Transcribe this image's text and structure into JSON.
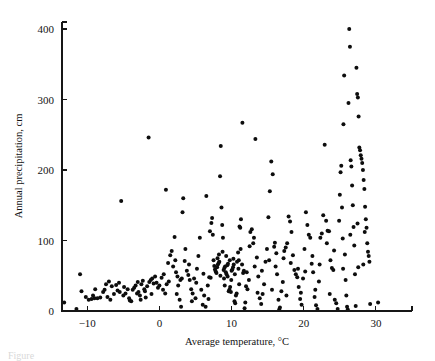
{
  "figure": {
    "caption": "Figure",
    "background_color": "#ffffff",
    "point_color": "#0d0d0d",
    "axis_color": "#161616"
  },
  "chart_data": {
    "type": "scatter",
    "title": "",
    "xlabel": "Average temperature, °C",
    "ylabel": "Annual precipitation, cm",
    "xlim": [
      -13.5,
      35.0
    ],
    "ylim": [
      0,
      410
    ],
    "xticks": [
      -10,
      0,
      10,
      20,
      30
    ],
    "xtick_labels": [
      "−10",
      "0",
      "10",
      "20",
      "30"
    ],
    "yticks": [
      0,
      100,
      200,
      300,
      400
    ],
    "ytick_labels": [
      "0",
      "100",
      "200",
      "300",
      "400"
    ],
    "grid": false,
    "legend": null,
    "marker": "filled-circle",
    "marker_size_px": 4.0,
    "series": [
      {
        "name": "Weather stations",
        "points": [
          [
            -13.2,
            12
          ],
          [
            -11.5,
            3
          ],
          [
            -11.0,
            52
          ],
          [
            -10.8,
            28
          ],
          [
            -10.2,
            20
          ],
          [
            -9.8,
            16
          ],
          [
            -9.4,
            17
          ],
          [
            -9.0,
            18
          ],
          [
            -8.6,
            18
          ],
          [
            -8.2,
            19
          ],
          [
            -7.8,
            27
          ],
          [
            -7.4,
            38
          ],
          [
            -7.0,
            42
          ],
          [
            -6.6,
            35
          ],
          [
            -6.3,
            24
          ],
          [
            -6.0,
            37
          ],
          [
            -5.6,
            40
          ],
          [
            -5.3,
            156
          ],
          [
            -5.0,
            22
          ],
          [
            -4.7,
            25
          ],
          [
            -4.4,
            31
          ],
          [
            -4.1,
            15
          ],
          [
            -3.9,
            14
          ],
          [
            -3.7,
            30
          ],
          [
            -3.5,
            33
          ],
          [
            -3.3,
            36
          ],
          [
            -3.1,
            25
          ],
          [
            -2.9,
            27
          ],
          [
            -2.7,
            22
          ],
          [
            -2.5,
            38
          ],
          [
            -2.3,
            43
          ],
          [
            -2.1,
            31
          ],
          [
            -1.9,
            19
          ],
          [
            -1.7,
            35
          ],
          [
            -1.5,
            246
          ],
          [
            -1.4,
            41
          ],
          [
            -1.2,
            44
          ],
          [
            -1.0,
            46
          ],
          [
            -0.8,
            39
          ],
          [
            -0.6,
            49
          ],
          [
            -0.4,
            40
          ],
          [
            -0.2,
            33
          ],
          [
            0.0,
            36
          ],
          [
            0.3,
            47
          ],
          [
            0.6,
            52
          ],
          [
            0.9,
            172
          ],
          [
            1.0,
            38
          ],
          [
            1.3,
            42
          ],
          [
            1.5,
            79
          ],
          [
            1.7,
            85
          ],
          [
            1.9,
            63
          ],
          [
            2.1,
            105
          ],
          [
            2.3,
            55
          ],
          [
            2.5,
            49
          ],
          [
            2.6,
            36
          ],
          [
            2.8,
            16
          ],
          [
            2.9,
            44
          ],
          [
            3.0,
            6
          ],
          [
            3.2,
            140
          ],
          [
            3.3,
            160
          ],
          [
            3.5,
            71
          ],
          [
            3.6,
            88
          ],
          [
            3.8,
            57
          ],
          [
            4.0,
            51
          ],
          [
            4.2,
            44
          ],
          [
            4.4,
            31
          ],
          [
            4.6,
            25
          ],
          [
            4.8,
            46
          ],
          [
            5.0,
            18
          ],
          [
            5.2,
            60
          ],
          [
            5.4,
            78
          ],
          [
            5.6,
            104
          ],
          [
            5.8,
            30
          ],
          [
            6.0,
            9
          ],
          [
            6.2,
            22
          ],
          [
            6.4,
            6
          ],
          [
            6.5,
            163
          ],
          [
            6.7,
            36
          ],
          [
            6.9,
            48
          ],
          [
            7.0,
            113
          ],
          [
            7.2,
            125
          ],
          [
            7.3,
            132
          ],
          [
            7.4,
            108
          ],
          [
            7.5,
            72
          ],
          [
            7.6,
            64
          ],
          [
            7.7,
            59
          ],
          [
            7.8,
            56
          ],
          [
            7.9,
            54
          ],
          [
            8.0,
            62
          ],
          [
            8.1,
            66
          ],
          [
            8.2,
            68
          ],
          [
            8.3,
            70
          ],
          [
            8.4,
            191
          ],
          [
            8.5,
            234
          ],
          [
            8.6,
            147
          ],
          [
            8.7,
            122
          ],
          [
            8.8,
            104
          ],
          [
            8.9,
            58
          ],
          [
            9.0,
            61
          ],
          [
            9.1,
            63
          ],
          [
            9.2,
            55
          ],
          [
            9.3,
            52
          ],
          [
            9.4,
            65
          ],
          [
            9.5,
            67
          ],
          [
            9.6,
            28
          ],
          [
            9.7,
            30
          ],
          [
            9.8,
            34
          ],
          [
            9.9,
            27
          ],
          [
            10.0,
            57
          ],
          [
            10.1,
            59
          ],
          [
            10.2,
            62
          ],
          [
            10.3,
            66
          ],
          [
            10.4,
            14
          ],
          [
            10.5,
            11
          ],
          [
            10.6,
            22
          ],
          [
            10.7,
            25
          ],
          [
            10.9,
            83
          ],
          [
            11.0,
            72
          ],
          [
            11.1,
            120
          ],
          [
            11.2,
            118
          ],
          [
            11.3,
            130
          ],
          [
            11.5,
            267
          ],
          [
            11.6,
            54
          ],
          [
            11.7,
            57
          ],
          [
            11.8,
            4
          ],
          [
            11.9,
            12
          ],
          [
            12.0,
            35
          ],
          [
            12.2,
            31
          ],
          [
            12.4,
            44
          ],
          [
            12.6,
            112
          ],
          [
            12.8,
            116
          ],
          [
            13.0,
            96
          ],
          [
            13.1,
            104
          ],
          [
            13.3,
            244
          ],
          [
            13.5,
            76
          ],
          [
            13.7,
            49
          ],
          [
            13.9,
            18
          ],
          [
            14.1,
            10
          ],
          [
            14.3,
            24
          ],
          [
            14.5,
            38
          ],
          [
            14.7,
            70
          ],
          [
            14.9,
            88
          ],
          [
            15.1,
            133
          ],
          [
            15.3,
            170
          ],
          [
            15.5,
            212
          ],
          [
            15.7,
            194
          ],
          [
            15.9,
            91
          ],
          [
            16.0,
            97
          ],
          [
            16.1,
            63
          ],
          [
            16.3,
            52
          ],
          [
            16.5,
            16
          ],
          [
            16.6,
            2
          ],
          [
            16.7,
            5
          ],
          [
            16.9,
            28
          ],
          [
            17.1,
            41
          ],
          [
            17.3,
            85
          ],
          [
            17.5,
            90
          ],
          [
            17.7,
            96
          ],
          [
            17.9,
            134
          ],
          [
            18.1,
            127
          ],
          [
            18.3,
            112
          ],
          [
            18.5,
            79
          ],
          [
            18.7,
            58
          ],
          [
            18.9,
            52
          ],
          [
            19.1,
            48
          ],
          [
            19.3,
            34
          ],
          [
            19.5,
            17
          ],
          [
            19.7,
            9
          ],
          [
            19.9,
            46
          ],
          [
            20.1,
            88
          ],
          [
            20.3,
            140
          ],
          [
            20.5,
            122
          ],
          [
            20.7,
            108
          ],
          [
            20.9,
            104
          ],
          [
            21.1,
            67
          ],
          [
            21.3,
            55
          ],
          [
            21.5,
            20
          ],
          [
            21.7,
            8
          ],
          [
            21.9,
            3
          ],
          [
            22.1,
            42
          ],
          [
            22.3,
            104
          ],
          [
            22.5,
            110
          ],
          [
            22.7,
            136
          ],
          [
            22.9,
            236
          ],
          [
            23.1,
            128
          ],
          [
            23.3,
            114
          ],
          [
            23.5,
            113
          ],
          [
            23.7,
            72
          ],
          [
            23.9,
            61
          ],
          [
            24.1,
            58
          ],
          [
            24.3,
            16
          ],
          [
            24.5,
            11
          ],
          [
            24.7,
            3
          ],
          [
            24.9,
            128
          ],
          [
            25.0,
            165
          ],
          [
            25.1,
            197
          ],
          [
            25.2,
            206
          ],
          [
            25.3,
            147
          ],
          [
            25.5,
            265
          ],
          [
            25.6,
            334
          ],
          [
            25.7,
            80
          ],
          [
            25.8,
            44
          ],
          [
            25.9,
            22
          ],
          [
            26.0,
            6
          ],
          [
            26.1,
            2
          ],
          [
            26.2,
            295
          ],
          [
            26.3,
            400
          ],
          [
            26.4,
            375
          ],
          [
            26.5,
            214
          ],
          [
            26.6,
            205
          ],
          [
            26.7,
            178
          ],
          [
            26.8,
            150
          ],
          [
            26.9,
            119
          ],
          [
            27.0,
            93
          ],
          [
            27.1,
            52
          ],
          [
            27.2,
            7
          ],
          [
            27.3,
            345
          ],
          [
            27.4,
            308
          ],
          [
            27.5,
            303
          ],
          [
            27.6,
            276
          ],
          [
            27.7,
            232
          ],
          [
            27.8,
            228
          ],
          [
            27.9,
            221
          ],
          [
            28.0,
            216
          ],
          [
            28.1,
            210
          ],
          [
            28.2,
            200
          ],
          [
            28.3,
            186
          ],
          [
            28.4,
            173
          ],
          [
            28.5,
            148
          ],
          [
            28.6,
            130
          ],
          [
            28.7,
            118
          ],
          [
            28.8,
            96
          ],
          [
            28.9,
            84
          ],
          [
            29.0,
            78
          ],
          [
            29.1,
            70
          ],
          [
            29.2,
            10
          ],
          [
            30.3,
            12
          ],
          [
            -8.9,
            31
          ],
          [
            -7.2,
            20
          ],
          [
            -5.8,
            29
          ],
          [
            -4.9,
            34
          ],
          [
            -3.0,
            41
          ],
          [
            -2.0,
            28
          ],
          [
            -1.1,
            24
          ],
          [
            0.5,
            30
          ],
          [
            1.2,
            68
          ],
          [
            2.2,
            72
          ],
          [
            3.1,
            46
          ],
          [
            4.1,
            66
          ],
          [
            5.1,
            40
          ],
          [
            6.1,
            53
          ],
          [
            7.1,
            47
          ],
          [
            8.05,
            75
          ],
          [
            8.45,
            50
          ],
          [
            8.95,
            46
          ],
          [
            9.45,
            49
          ],
          [
            9.95,
            44
          ],
          [
            10.45,
            52
          ],
          [
            10.95,
            60
          ],
          [
            11.45,
            66
          ],
          [
            12.1,
            55
          ],
          [
            13.2,
            63
          ],
          [
            14.2,
            57
          ],
          [
            15.2,
            72
          ],
          [
            16.2,
            82
          ],
          [
            17.2,
            75
          ],
          [
            18.2,
            68
          ],
          [
            19.2,
            60
          ],
          [
            20.2,
            56
          ],
          [
            21.2,
            78
          ],
          [
            22.2,
            66
          ],
          [
            23.2,
            96
          ],
          [
            24.2,
            86
          ],
          [
            25.4,
            103
          ],
          [
            26.45,
            108
          ],
          [
            27.45,
            124
          ],
          [
            28.45,
            112
          ],
          [
            -6.8,
            16
          ],
          [
            -4.2,
            18
          ],
          [
            -2.6,
            16
          ],
          [
            0.8,
            25
          ],
          [
            2.4,
            24
          ],
          [
            4.5,
            14
          ],
          [
            6.8,
            17
          ],
          [
            9.05,
            36
          ],
          [
            11.05,
            38
          ],
          [
            13.6,
            26
          ],
          [
            15.6,
            30
          ],
          [
            17.6,
            22
          ],
          [
            19.6,
            26
          ],
          [
            21.6,
            30
          ],
          [
            23.6,
            24
          ],
          [
            25.45,
            60
          ],
          [
            27.55,
            62
          ],
          [
            28.25,
            66
          ],
          [
            8.25,
            80
          ],
          [
            8.75,
            84
          ],
          [
            9.25,
            78
          ],
          [
            9.75,
            72
          ],
          [
            10.25,
            74
          ],
          [
            10.75,
            70
          ],
          [
            11.25,
            88
          ],
          [
            12.5,
            92
          ],
          [
            -9.2,
            22
          ],
          [
            -7.6,
            30
          ],
          [
            -5.5,
            27
          ]
        ]
      }
    ]
  },
  "axes": {
    "x_title": "Average temperature, °C",
    "y_title": "Annual precipitation, cm"
  }
}
